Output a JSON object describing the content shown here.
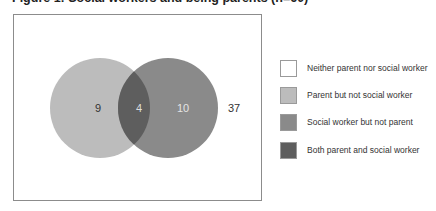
{
  "figure": {
    "title": "Figure 1: Social workers and being parents (n=60)"
  },
  "venn": {
    "sets": [
      {
        "name": "Parent",
        "cx": 100,
        "cy": 108,
        "r": 50,
        "color": "#bcbcbc"
      },
      {
        "name": "Social worker",
        "cx": 168,
        "cy": 108,
        "r": 50,
        "color": "#8a8a8a"
      }
    ],
    "overlap_color": "#5e5e5e",
    "counts": {
      "parent_only": "9",
      "both": "4",
      "social_worker_only": "10",
      "neither": "37"
    }
  },
  "legend": {
    "items": [
      {
        "label": "Neither parent nor social worker",
        "color": "#ffffff"
      },
      {
        "label": "Parent but not social worker",
        "color": "#bcbcbc"
      },
      {
        "label": "Social worker but not parent",
        "color": "#8a8a8a"
      },
      {
        "label": "Both parent and social worker",
        "color": "#5e5e5e"
      }
    ]
  },
  "chart_data": {
    "type": "venn",
    "title": "Figure 1: Social workers and being parents (n=60)",
    "sets": [
      "Parent",
      "Social worker"
    ],
    "regions": [
      {
        "region": "Neither parent nor social worker",
        "value": 37
      },
      {
        "region": "Parent but not social worker",
        "value": 9
      },
      {
        "region": "Social worker but not parent",
        "value": 10
      },
      {
        "region": "Both parent and social worker",
        "value": 4
      }
    ],
    "total": 60,
    "legend_position": "right"
  }
}
